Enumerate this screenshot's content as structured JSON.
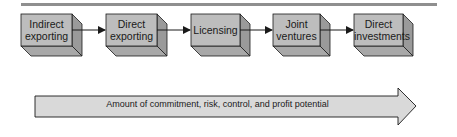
{
  "diagram": {
    "stages": [
      {
        "line1": "Indirect",
        "line2": "exporting"
      },
      {
        "line1": "Direct",
        "line2": "exporting"
      },
      {
        "line1": "Licensing",
        "line2": ""
      },
      {
        "line1": "Joint",
        "line2": "ventures"
      },
      {
        "line1": "Direct",
        "line2": "investments"
      }
    ],
    "arrow_label": "Amount of commitment, risk, control, and profit potential",
    "colors": {
      "box_front": "#bdbdbd",
      "box_side": "#9a9a9a",
      "box_bottom": "#a8a8a8",
      "arrow_fill": "#d9d9d9",
      "rule": "#8f8f8f",
      "stroke": "#1a1a1a"
    }
  }
}
